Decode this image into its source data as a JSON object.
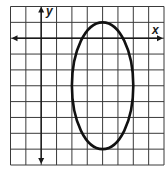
{
  "chart_data": {
    "type": "line",
    "title": "",
    "xlabel": "x",
    "ylabel": "y",
    "grid": true,
    "xlim": [
      -2,
      8
    ],
    "ylim": [
      -8,
      2
    ],
    "x_axis_at_y": 0,
    "y_axis_at_x": 0,
    "tick_labels": false,
    "series": [
      {
        "name": "ellipse",
        "shape": "ellipse",
        "center": [
          4,
          -3
        ],
        "semi_axis_x": 2,
        "semi_axis_y": 4,
        "equation": "(x-4)^2/4 + (y+3)^2/16 = 1"
      }
    ]
  },
  "axes": {
    "x_label": "x",
    "y_label": "y"
  },
  "colors": {
    "grid": "#3a3a3a",
    "axis": "#1a1a1a",
    "curve": "#111111",
    "background": "#ffffff"
  }
}
